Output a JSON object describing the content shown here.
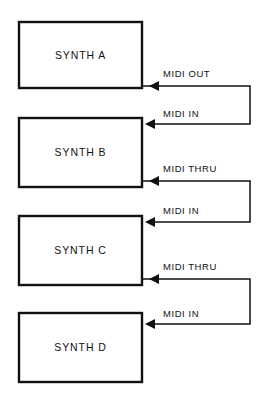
{
  "diagram": {
    "colors": {
      "stroke": "#111111",
      "background": "#ffffff",
      "box_fill": "#ffffff"
    },
    "boxes": [
      {
        "id": "synth-a",
        "label": "SYNTH A",
        "x": 19,
        "y": 22,
        "w": 123,
        "h": 66
      },
      {
        "id": "synth-b",
        "label": "SYNTH B",
        "x": 19,
        "y": 118,
        "w": 123,
        "h": 69
      },
      {
        "id": "synth-c",
        "label": "SYNTH C",
        "x": 19,
        "y": 216,
        "w": 123,
        "h": 69
      },
      {
        "id": "synth-d",
        "label": "SYNTH D",
        "x": 19,
        "y": 313,
        "w": 123,
        "h": 69
      }
    ],
    "connections": [
      {
        "id": "a-out-to-b-in",
        "from": "synth-a",
        "to": "synth-b",
        "out_label": "MIDI OUT",
        "in_label": "MIDI IN",
        "out_label_x": 163,
        "out_label_y": 77,
        "in_label_x": 163,
        "in_label_y": 117,
        "out_y": 86,
        "in_y": 124,
        "turn_x": 250
      },
      {
        "id": "b-thru-to-c-in",
        "from": "synth-b",
        "to": "synth-c",
        "out_label": "MIDI THRU",
        "in_label": "MIDI IN",
        "out_label_x": 163,
        "out_label_y": 172,
        "in_label_x": 163,
        "in_label_y": 214,
        "out_y": 181,
        "in_y": 222,
        "turn_x": 250
      },
      {
        "id": "c-thru-to-d-in",
        "from": "synth-c",
        "to": "synth-d",
        "out_label": "MIDI THRU",
        "in_label": "MIDI IN",
        "out_label_x": 163,
        "out_label_y": 270,
        "in_label_x": 163,
        "in_label_y": 317,
        "out_y": 279,
        "in_y": 324,
        "turn_x": 250
      }
    ]
  }
}
